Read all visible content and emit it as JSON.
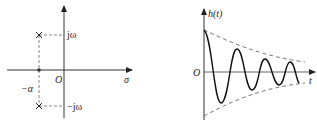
{
  "left_diagram": {
    "title": "s-plane pole plot",
    "labels": {
      "j_omega": "jω",
      "neg_j_omega": "−jω",
      "origin": "O",
      "sigma": "σ",
      "neg_alpha": "−α"
    },
    "poles": [
      {
        "sigma": "−α",
        "omega": "jω"
      },
      {
        "sigma": "−α",
        "omega": "−jω"
      }
    ]
  },
  "right_diagram": {
    "title": "impulse response (damped oscillation)",
    "labels": {
      "y_axis": "h(t)",
      "x_axis": "t",
      "origin": "O"
    }
  },
  "colors": {
    "line": "#222222",
    "dashed": "#555555"
  }
}
